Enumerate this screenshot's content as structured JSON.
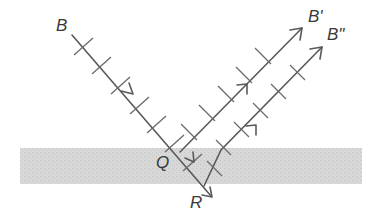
{
  "diagram": {
    "type": "wave reflection at a thin layer (wavefronts drawn as cross ticks)",
    "labels": {
      "incident": "B",
      "reflected_1": "B'",
      "reflected_2": "B\"",
      "point_q": "Q",
      "point_r": "R"
    },
    "colors": {
      "layer_fill": "#d6d6d6",
      "ray": "#5a5a5a",
      "text": "#3a3a3a"
    },
    "layer": {
      "x": 20,
      "y": 148,
      "width": 342,
      "height": 36
    }
  }
}
